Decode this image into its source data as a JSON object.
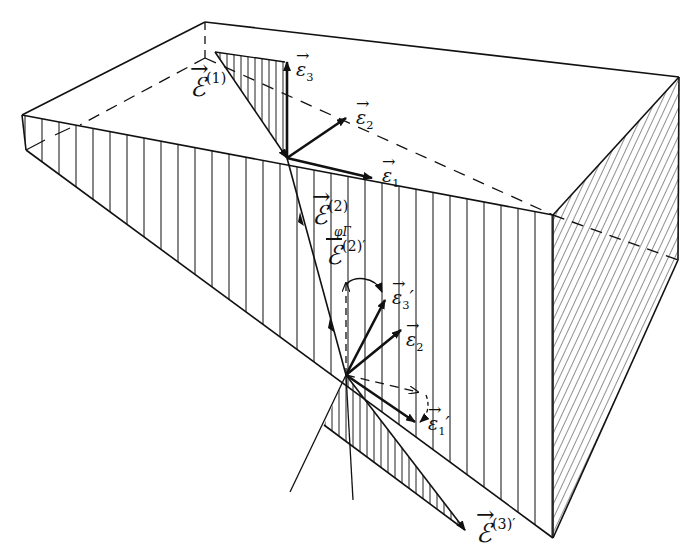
{
  "figure": {
    "colors": {
      "ink": "#111111",
      "background": "#ffffff"
    }
  },
  "labels": {
    "E1": {
      "symbol": "ℰ",
      "superscript": "(1)"
    },
    "E2": {
      "symbol": "ℰ",
      "superscript": "(2)"
    },
    "E2prime": {
      "symbol": "ℰ",
      "superscript": "(2)′",
      "overscript": "φΓ"
    },
    "E3prime": {
      "symbol": "ℰ",
      "superscript": "(3)′"
    },
    "e1": {
      "symbol": "ε",
      "subscript": "1"
    },
    "e2": {
      "symbol": "ε",
      "subscript": "2"
    },
    "e3": {
      "symbol": "ε",
      "subscript": "3"
    },
    "e1prime": {
      "symbol": "ε",
      "subscript": "1",
      "prime": "′"
    },
    "e2prime": {
      "symbol": "ε",
      "subscript": "2"
    },
    "e3prime": {
      "symbol": "ε",
      "subscript": "3",
      "prime": "′"
    }
  }
}
